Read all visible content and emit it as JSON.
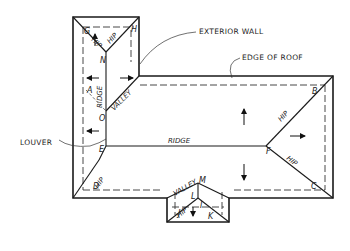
{
  "diagram": {
    "type": "roof-plan",
    "callouts": {
      "exterior_wall": "EXTERIOR WALL",
      "edge_of_roof": "EDGE OF ROOF",
      "louver": "LOUVER"
    },
    "line_labels": {
      "hip": "HIP",
      "ridge": "RIDGE",
      "valley": "VALLEY"
    },
    "points": {
      "A": "A",
      "B": "B",
      "C": "C",
      "D": "D",
      "E": "E",
      "F": "F",
      "G": "G",
      "H": "H",
      "I": "I",
      "J": "J",
      "K": "K",
      "L": "L",
      "M": "M",
      "N": "N",
      "O": "O"
    },
    "colors": {
      "line": "#1a1a1a",
      "background": "#ffffff"
    }
  }
}
